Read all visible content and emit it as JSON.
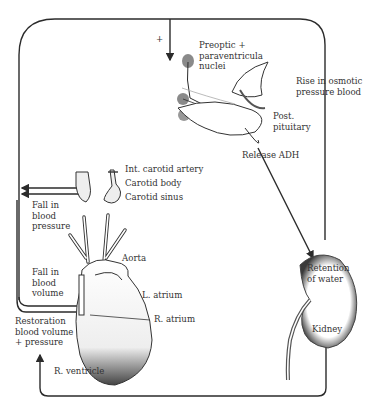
{
  "diagram": {
    "type": "physiological feedback loop",
    "plus_sign": "+",
    "labels": {
      "preoptic": [
        "Preoptic +",
        "paraventricula",
        "nuclei"
      ],
      "osmotic": [
        "Rise in osmotic",
        "pressure blood"
      ],
      "post_pituitary": [
        "Post.",
        "pituitary"
      ],
      "release_adh": "Release ADH",
      "int_carotid_artery": "Int. carotid artery",
      "carotid_body": "Carotid body",
      "carotid_sinus": "Carotid sinus",
      "fall_bp": [
        "Fall in",
        "blood",
        "pressure"
      ],
      "fall_bv": [
        "Fall in",
        "blood",
        "volume"
      ],
      "aorta": "Aorta",
      "l_atrium": "L. atrium",
      "r_atrium": "R. atrium",
      "r_ventricle": "R. ventricle",
      "restoration": [
        "Restoration",
        "blood volume",
        "+ pressure"
      ],
      "retention": [
        "Retention",
        "of water"
      ],
      "kidney": "Kidney"
    },
    "colors": {
      "line": "#2b2b2b",
      "shading": "#555555",
      "nuclei": "#8a8a8a"
    }
  }
}
